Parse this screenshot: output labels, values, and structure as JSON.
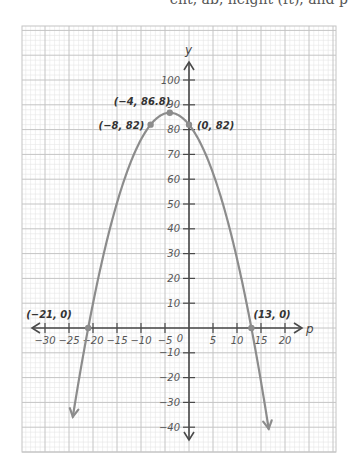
{
  "header": {
    "cutoff_text": "ent, ab, height (ft), and p"
  },
  "colors": {
    "curve": "#8c8c8c",
    "axis": "#4a4a4a",
    "grid_major": "#c4c4c4",
    "grid_minor": "#e6e6e6",
    "point": "#8c8c8c",
    "background": "#ffffff"
  },
  "layout": {
    "grid_left": 22,
    "grid_top": 26,
    "grid_right": 336,
    "grid_bottom": 452,
    "origin_x": 189,
    "origin_y": 328,
    "px_per_unit_x": 4.8,
    "px_per_unit_y": 2.48
  },
  "chart_data": {
    "type": "line",
    "title": "",
    "xlabel": "p",
    "ylabel": "y",
    "xlim": [
      -34,
      31
    ],
    "ylim": [
      -50,
      120
    ],
    "grid": true,
    "x_ticks": [
      -30,
      -25,
      -20,
      -15,
      -10,
      -5,
      5,
      10,
      15,
      20
    ],
    "x_tick_labels": [
      "−30",
      "−25",
      "−20",
      "−15",
      "−10",
      "−5",
      "5",
      "10",
      "15",
      "20"
    ],
    "origin_label": "0",
    "y_ticks": [
      100,
      90,
      80,
      70,
      60,
      50,
      40,
      30,
      20,
      10,
      -10,
      -20,
      -30,
      -40
    ],
    "y_tick_labels": [
      "100",
      "90",
      "80",
      "70",
      "60",
      "50",
      "40",
      "30",
      "20",
      "10",
      "−10",
      "−20",
      "−30",
      "−40"
    ],
    "series": [
      {
        "name": "parabola",
        "equation": "y = -0.3003(p + 21)(p - 13)",
        "roots": [
          -21,
          13
        ],
        "vertex": [
          -4,
          86.8
        ],
        "p_start": -24.2,
        "p_end": 16.6,
        "arrow_ends": true
      }
    ],
    "points": [
      {
        "x": -4,
        "y": 86.8,
        "label": "(−4, 86.8)",
        "label_dx": -56,
        "label_dy": -8
      },
      {
        "x": -8,
        "y": 82,
        "label": "(−8, 82)",
        "label_dx": -52,
        "label_dy": 4
      },
      {
        "x": 0,
        "y": 82,
        "label": "(0, 82)",
        "label_dx": 8,
        "label_dy": 4
      },
      {
        "x": -21,
        "y": 0,
        "label": "(−21, 0)",
        "label_dx": -62,
        "label_dy": -10
      },
      {
        "x": 13,
        "y": 0,
        "label": "(13, 0)",
        "label_dx": 2,
        "label_dy": -10
      }
    ]
  }
}
